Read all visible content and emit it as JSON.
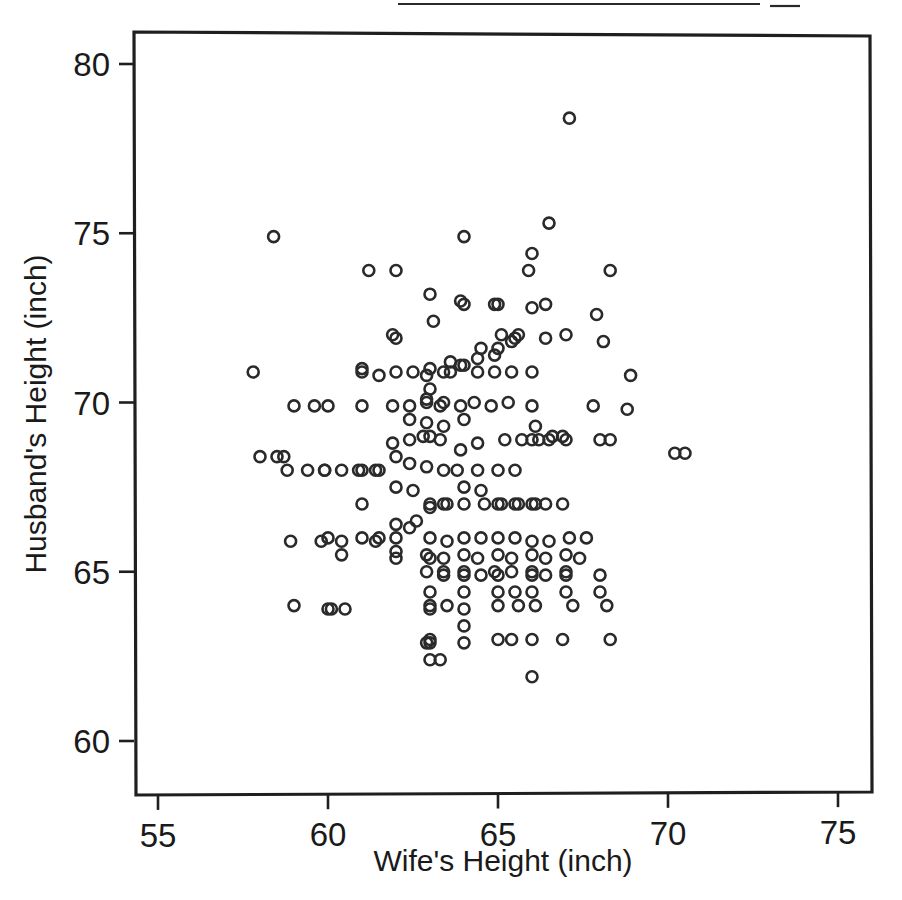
{
  "chart_data": {
    "type": "scatter",
    "title": "",
    "xlabel": "Wife's Height (inch)",
    "ylabel": "Husband's Height (inch)",
    "xlim": [
      54.3,
      76.1
    ],
    "ylim": [
      59.0,
      81.0
    ],
    "xticks": [
      55,
      60,
      65,
      70,
      75
    ],
    "xtick_labels": [
      "55",
      "60",
      "65",
      "70",
      "75"
    ],
    "yticks": [
      60,
      65,
      70,
      75,
      80
    ],
    "ytick_labels": [
      "60",
      "65",
      "70",
      "75",
      "80"
    ],
    "grid": false,
    "legend": null,
    "marker": "open-circle",
    "marker_color": "#2a2a2a",
    "marker_size": 11,
    "n_points": 199,
    "x": [
      67.1,
      58.4,
      66.5,
      61.2,
      62.0,
      64.0,
      66.0,
      65.9,
      63.0,
      63.9,
      68.3,
      67.9,
      61.9,
      64.0,
      64.9,
      65.0,
      65.1,
      66.0,
      65.0,
      63.1,
      64.5,
      66.4,
      67.0,
      57.8,
      61.0,
      62.0,
      63.0,
      63.6,
      64.0,
      64.4,
      64.9,
      65.4,
      65.5,
      65.6,
      66.4,
      68.1,
      59.0,
      59.6,
      61.0,
      61.5,
      62.0,
      62.5,
      62.9,
      63.4,
      63.6,
      63.9,
      64.4,
      64.9,
      65.4,
      66.0,
      68.9,
      70.2,
      63.0,
      62.9,
      58.0,
      58.7,
      60.0,
      61.0,
      61.9,
      62.4,
      62.9,
      63.3,
      63.4,
      63.9,
      64.3,
      64.8,
      65.3,
      66.0,
      67.8,
      68.8,
      62.4,
      62.9,
      63.4,
      64.0,
      63.0,
      66.1,
      66.9,
      58.5,
      59.9,
      60.9,
      61.4,
      61.9,
      62.4,
      62.8,
      63.3,
      63.9,
      64.4,
      65.2,
      65.7,
      66.2,
      66.6,
      68.3,
      70.5,
      58.8,
      59.4,
      59.9,
      60.4,
      61.0,
      61.5,
      62.0,
      62.4,
      62.9,
      63.4,
      63.8,
      64.4,
      65.0,
      65.5,
      66.0,
      66.5,
      67.0,
      68.0,
      61.0,
      62.0,
      62.5,
      63.0,
      63.4,
      64.0,
      64.5,
      65.0,
      65.5,
      66.0,
      66.4,
      66.9,
      59.8,
      60.4,
      61.5,
      62.0,
      62.6,
      63.0,
      63.5,
      64.0,
      64.6,
      65.1,
      65.6,
      66.1,
      60.0,
      61.0,
      62.0,
      62.4,
      63.0,
      63.5,
      64.0,
      64.5,
      65.0,
      65.5,
      66.0,
      66.5,
      67.1,
      67.6,
      62.0,
      62.9,
      63.4,
      64.0,
      64.4,
      65.0,
      65.4,
      66.0,
      66.4,
      67.0,
      67.4,
      58.9,
      60.4,
      61.4,
      62.0,
      63.0,
      63.4,
      64.0,
      64.9,
      65.4,
      66.0,
      67.0,
      62.9,
      63.4,
      64.0,
      64.5,
      65.0,
      66.0,
      66.4,
      67.0,
      68.0,
      63.0,
      64.0,
      65.0,
      65.5,
      66.0,
      67.0,
      68.0,
      59.0,
      60.5,
      63.0,
      63.5,
      65.0,
      65.6,
      66.1,
      67.2,
      68.2,
      60.1,
      63.0,
      64.0,
      63.0,
      64.0,
      65.0,
      65.4,
      66.0,
      66.9,
      68.3,
      60.0,
      63.0,
      64.0,
      62.9,
      63.3,
      63.0,
      66.0
    ],
    "y": [
      78.4,
      74.9,
      75.3,
      73.9,
      73.9,
      74.9,
      74.4,
      73.9,
      73.2,
      73.0,
      73.9,
      72.6,
      72.0,
      72.9,
      72.9,
      72.9,
      72.0,
      72.8,
      71.6,
      72.4,
      71.6,
      72.9,
      72.0,
      70.9,
      71.0,
      71.9,
      71.0,
      71.2,
      71.1,
      71.3,
      71.4,
      71.8,
      71.9,
      72.0,
      71.9,
      71.8,
      69.9,
      69.9,
      70.9,
      70.8,
      70.9,
      70.9,
      70.8,
      70.9,
      70.9,
      71.1,
      70.9,
      70.9,
      70.9,
      70.9,
      70.8,
      68.5,
      70.4,
      70.1,
      68.4,
      68.4,
      69.9,
      69.9,
      69.9,
      69.9,
      70.0,
      69.9,
      70.0,
      69.9,
      70.0,
      69.9,
      70.0,
      69.9,
      69.9,
      69.8,
      69.5,
      69.4,
      69.3,
      69.5,
      69.0,
      69.3,
      69.0,
      68.4,
      68.0,
      68.0,
      68.0,
      68.8,
      68.9,
      69.0,
      68.9,
      68.6,
      68.8,
      68.9,
      68.9,
      68.9,
      69.0,
      68.9,
      68.5,
      68.0,
      68.0,
      68.0,
      68.0,
      68.0,
      68.0,
      68.4,
      68.2,
      68.1,
      68.0,
      68.0,
      68.0,
      68.0,
      68.0,
      68.9,
      68.9,
      68.9,
      68.9,
      67.0,
      67.5,
      67.4,
      67.0,
      67.0,
      67.5,
      67.4,
      67.0,
      67.0,
      67.0,
      67.0,
      67.0,
      65.9,
      65.5,
      66.0,
      66.4,
      66.5,
      66.9,
      67.0,
      67.0,
      67.0,
      67.0,
      67.0,
      67.0,
      66.0,
      66.0,
      66.0,
      66.3,
      66.0,
      65.9,
      66.0,
      66.0,
      66.0,
      66.0,
      65.9,
      65.9,
      66.0,
      66.0,
      65.6,
      65.5,
      65.4,
      65.5,
      65.4,
      65.5,
      65.4,
      65.5,
      65.4,
      65.5,
      65.4,
      65.9,
      65.9,
      65.9,
      65.4,
      65.4,
      65.0,
      65.0,
      65.0,
      65.0,
      65.0,
      65.0,
      65.0,
      64.9,
      64.9,
      64.9,
      64.9,
      64.9,
      64.9,
      64.9,
      64.9,
      64.4,
      64.4,
      64.4,
      64.4,
      64.4,
      64.4,
      64.4,
      64.0,
      63.9,
      64.0,
      64.0,
      64.0,
      64.0,
      64.0,
      64.0,
      64.0,
      63.9,
      63.9,
      63.9,
      63.0,
      63.4,
      63.0,
      63.0,
      63.0,
      63.0,
      63.0,
      63.9,
      62.9,
      62.9,
      62.9,
      62.4,
      62.4,
      61.9
    ]
  },
  "axes": {
    "x_title": "Wife's Height (inch)",
    "y_title": "Husband's Height (inch)",
    "x_tick_labels": [
      "55",
      "60",
      "65",
      "70",
      "75"
    ],
    "y_tick_labels": [
      "60",
      "65",
      "70",
      "75",
      "80"
    ]
  }
}
